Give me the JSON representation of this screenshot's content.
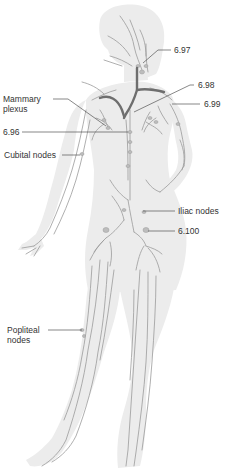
{
  "figure": {
    "colors": {
      "body_fill": "#ececec",
      "vessel": "#9a9a9a",
      "major_duct": "#6e6e6e",
      "leader_line": "#555555",
      "label_text": "#333333"
    }
  },
  "labels": {
    "l697": "6.97",
    "l698": "6.98",
    "l699": "6.99",
    "mammary": "Mammary plexus",
    "l696": "6.96",
    "cubital": "Cubital nodes",
    "iliac": "Iliac nodes",
    "l6100": "6.100",
    "popliteal": "Popliteal nodes"
  }
}
